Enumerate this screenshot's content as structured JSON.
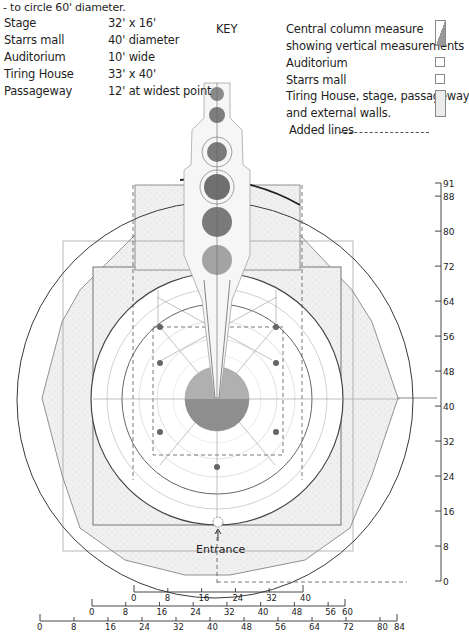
{
  "intro": "- to circle 60' diameter.",
  "specs": [
    {
      "label": "Stage",
      "value": "32' x 16'"
    },
    {
      "label": "Starrs mall",
      "value": "40' diameter"
    },
    {
      "label": "Auditorium",
      "value": "10' wide"
    },
    {
      "label": "Tiring House",
      "value": "33' x 40'"
    },
    {
      "label": "Passageway",
      "value": "12' at widest point"
    }
  ],
  "key": {
    "title": "KEY",
    "items": [
      {
        "text": "Central column measure",
        "swatch": "central-column"
      },
      {
        "text": "showing vertical measurements",
        "swatch": null
      },
      {
        "text": "Auditorium",
        "swatch": "auditorium"
      },
      {
        "text": "Starrs mall",
        "swatch": "starrs-mall"
      },
      {
        "text": "Tiring House, stage, passageway",
        "swatch": "tiring-house"
      },
      {
        "text": "and external walls.",
        "swatch": null
      },
      {
        "text": "Added lines",
        "swatch": "dashed"
      }
    ]
  },
  "colors": {
    "ink": "#3a3a3a",
    "stipple_fill": "#ececec",
    "dark_disc": "#7a7a7a",
    "mid_disc": "#9a9a9a",
    "light_disc": "#b4b4b4"
  },
  "annotations": {
    "entrance": "Entrance"
  },
  "scales": {
    "vertical": {
      "ticks": [
        "91",
        "88",
        "80",
        "72",
        "64",
        "56",
        "48",
        "40",
        "32",
        "24",
        "16",
        "8",
        "0"
      ],
      "values": [
        91,
        88,
        80,
        72,
        64,
        56,
        48,
        40,
        32,
        24,
        16,
        8,
        0
      ]
    },
    "bottom_1": {
      "ticks": [
        "0",
        "8",
        "16",
        "24",
        "32",
        "40"
      ],
      "values": [
        0,
        8,
        16,
        24,
        32,
        40
      ]
    },
    "bottom_2": {
      "ticks": [
        "0",
        "8",
        "16",
        "24",
        "32",
        "40",
        "48",
        "56",
        "60"
      ],
      "values": [
        0,
        8,
        16,
        24,
        32,
        40,
        48,
        56,
        60
      ]
    },
    "bottom_3": {
      "ticks": [
        "0",
        "8",
        "16",
        "24",
        "32",
        "40",
        "48",
        "56",
        "64",
        "72",
        "80",
        "84"
      ],
      "values": [
        0,
        8,
        16,
        24,
        32,
        40,
        48,
        56,
        64,
        72,
        80,
        84
      ]
    }
  }
}
